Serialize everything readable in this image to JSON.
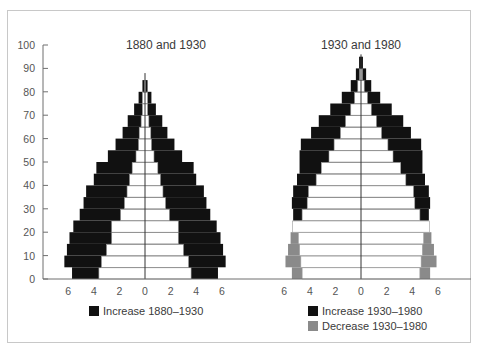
{
  "chart_data": [
    {
      "type": "bar",
      "subtype": "population-pyramid",
      "title": "1880 and 1930",
      "ylabel": "Age",
      "xlabel": "Percent of population",
      "ylim": [
        0,
        100
      ],
      "xlim": [
        -6,
        6
      ],
      "yticks": [
        0,
        10,
        20,
        30,
        40,
        50,
        60,
        70,
        80,
        90,
        100
      ],
      "xtick_labels": [
        "6",
        "4",
        "2",
        "0",
        "2",
        "4",
        "6"
      ],
      "grid": false,
      "age_bands": [
        "0-5",
        "5-10",
        "10-15",
        "15-20",
        "20-25",
        "25-30",
        "30-35",
        "35-40",
        "40-45",
        "45-50",
        "50-55",
        "55-60",
        "60-65",
        "65-70",
        "70-75",
        "75-80",
        "80-85"
      ],
      "series": [
        {
          "name": "1880 (base, white)",
          "color": "#ffffff",
          "values": [
            3.6,
            3.4,
            3.0,
            2.6,
            2.6,
            1.9,
            1.6,
            1.4,
            1.2,
            1.0,
            0.7,
            0.5,
            0.45,
            0.3,
            0.2,
            0.2,
            0.05
          ]
        },
        {
          "name": "1930 total",
          "color": "#111111",
          "values": [
            5.7,
            6.3,
            6.1,
            5.9,
            5.6,
            5.1,
            4.8,
            4.6,
            4.0,
            3.8,
            2.9,
            2.3,
            1.75,
            1.35,
            0.85,
            0.5,
            0.2
          ]
        }
      ],
      "legend": [
        {
          "label": "Increase 1880–1930",
          "color": "#111111"
        }
      ]
    },
    {
      "type": "bar",
      "subtype": "population-pyramid",
      "title": "1930 and 1980",
      "ylim": [
        0,
        100
      ],
      "xlim": [
        -6,
        6
      ],
      "xtick_labels": [
        "6",
        "4",
        "2",
        "0",
        "2",
        "4",
        "6"
      ],
      "grid": false,
      "age_bands": [
        "0-5",
        "5-10",
        "10-15",
        "15-20",
        "20-25",
        "25-30",
        "30-35",
        "35-40",
        "40-45",
        "45-50",
        "50-55",
        "55-60",
        "60-65",
        "65-70",
        "70-75",
        "75-80",
        "80-85",
        "85-90",
        "90-95"
      ],
      "series": [
        {
          "name": "1980 (white, where smaller than 1930)",
          "color": "#ffffff",
          "values": [
            4.6,
            4.7,
            4.8,
            4.9,
            5.3,
            4.6,
            4.2,
            4.1,
            3.5,
            3.1,
            2.5,
            2.1,
            1.6,
            1.2,
            0.8,
            0.5,
            0.25,
            0.1,
            0.0
          ]
        },
        {
          "name": "1930 total / 1980 total outer",
          "color": "#111111",
          "values": [
            5.4,
            5.9,
            5.7,
            5.5,
            5.3,
            5.3,
            5.4,
            5.3,
            5.0,
            4.8,
            4.8,
            4.7,
            3.9,
            3.3,
            2.4,
            1.5,
            0.8,
            0.4,
            0.15
          ]
        }
      ],
      "increase_rows": [
        "25-30",
        "30-35",
        "35-40",
        "40-45",
        "45-50",
        "50-55",
        "55-60",
        "60-65",
        "65-70",
        "70-75",
        "75-80",
        "80-85",
        "85-90",
        "90-95"
      ],
      "decrease_rows": [
        "0-5",
        "5-10",
        "10-15",
        "15-20"
      ],
      "legend": [
        {
          "label": "Increase 1930–1980",
          "color": "#111111"
        },
        {
          "label": "Decrease 1930–1980",
          "color": "#8a8a8a"
        }
      ]
    }
  ],
  "layout": {
    "yaxis_x": 43,
    "baseline_y": 279,
    "top_y": 45,
    "left_center_x": 145,
    "right_center_x": 361,
    "px_per_unit": 12.8,
    "axis_right_x": 471
  },
  "colors": {
    "increase": "#111111",
    "decrease": "#8a8a8a",
    "base": "#ffffff",
    "line": "#6f6f6f",
    "row_line": "#9a9a9a"
  },
  "pyramids": [
    {
      "title": "1880 and 1930",
      "rows": [
        {
          "inner": 3.6,
          "outer": 5.7,
          "kind": "inc"
        },
        {
          "inner": 3.4,
          "outer": 6.3,
          "kind": "inc"
        },
        {
          "inner": 3.0,
          "outer": 6.1,
          "kind": "inc"
        },
        {
          "inner": 2.6,
          "outer": 5.9,
          "kind": "inc"
        },
        {
          "inner": 2.6,
          "outer": 5.6,
          "kind": "inc"
        },
        {
          "inner": 1.9,
          "outer": 5.1,
          "kind": "inc"
        },
        {
          "inner": 1.6,
          "outer": 4.8,
          "kind": "inc"
        },
        {
          "inner": 1.4,
          "outer": 4.6,
          "kind": "inc"
        },
        {
          "inner": 1.2,
          "outer": 4.0,
          "kind": "inc"
        },
        {
          "inner": 1.0,
          "outer": 3.8,
          "kind": "inc"
        },
        {
          "inner": 0.7,
          "outer": 2.9,
          "kind": "inc"
        },
        {
          "inner": 0.5,
          "outer": 2.3,
          "kind": "inc"
        },
        {
          "inner": 0.45,
          "outer": 1.75,
          "kind": "inc"
        },
        {
          "inner": 0.3,
          "outer": 1.35,
          "kind": "inc"
        },
        {
          "inner": 0.2,
          "outer": 0.85,
          "kind": "inc"
        },
        {
          "inner": 0.2,
          "outer": 0.5,
          "kind": "inc"
        },
        {
          "inner": 0.05,
          "outer": 0.2,
          "kind": "inc"
        }
      ],
      "center_line_top_age": 88
    },
    {
      "title": "1930 and 1980",
      "rows": [
        {
          "inner": 4.6,
          "outer": 5.4,
          "kind": "dec"
        },
        {
          "inner": 4.7,
          "outer": 5.9,
          "kind": "dec"
        },
        {
          "inner": 4.8,
          "outer": 5.7,
          "kind": "dec"
        },
        {
          "inner": 4.9,
          "outer": 5.5,
          "kind": "dec"
        },
        {
          "inner": 5.35,
          "outer": 5.35,
          "kind": "none"
        },
        {
          "inner": 4.6,
          "outer": 5.3,
          "kind": "inc"
        },
        {
          "inner": 4.2,
          "outer": 5.4,
          "kind": "inc"
        },
        {
          "inner": 4.1,
          "outer": 5.3,
          "kind": "inc"
        },
        {
          "inner": 3.5,
          "outer": 5.0,
          "kind": "inc"
        },
        {
          "inner": 3.1,
          "outer": 4.8,
          "kind": "inc"
        },
        {
          "inner": 2.5,
          "outer": 4.8,
          "kind": "inc"
        },
        {
          "inner": 2.1,
          "outer": 4.7,
          "kind": "inc"
        },
        {
          "inner": 1.6,
          "outer": 3.9,
          "kind": "inc"
        },
        {
          "inner": 1.2,
          "outer": 3.3,
          "kind": "inc"
        },
        {
          "inner": 0.8,
          "outer": 2.4,
          "kind": "inc"
        },
        {
          "inner": 0.5,
          "outer": 1.5,
          "kind": "inc"
        },
        {
          "inner": 0.25,
          "outer": 0.8,
          "kind": "inc"
        },
        {
          "inner": 0.1,
          "outer": 0.4,
          "kind": "inc"
        },
        {
          "inner": 0.0,
          "outer": 0.15,
          "kind": "inc"
        }
      ],
      "center_line_top_age": 96
    }
  ],
  "titles": {
    "left": "1880 and 1930",
    "right": "1930 and 1980"
  },
  "yaxis": {
    "ticks": [
      "0",
      "10",
      "20",
      "30",
      "40",
      "50",
      "60",
      "70",
      "80",
      "90",
      "100"
    ]
  },
  "xaxis": {
    "labels": [
      "6",
      "4",
      "2",
      "0",
      "2",
      "4",
      "6"
    ]
  },
  "legend": {
    "left": {
      "label": "Increase 1880–1930"
    },
    "right_increase": {
      "label": "Increase 1930–1980"
    },
    "right_decrease": {
      "label": "Decrease 1930–1980"
    }
  }
}
